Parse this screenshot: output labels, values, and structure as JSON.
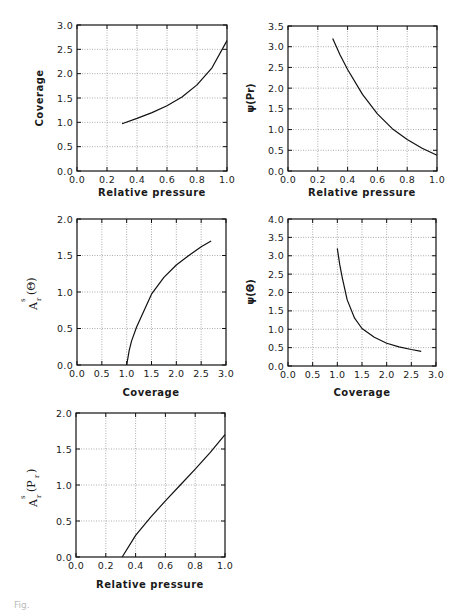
{
  "figure": {
    "caption_stub": "Fig."
  },
  "chart_data": [
    {
      "id": "coverage-vs-pressure",
      "type": "line",
      "title": "",
      "xlabel": "Relative pressure",
      "ylabel": "Coverage",
      "xlim": [
        0.0,
        1.0
      ],
      "ylim": [
        0.0,
        3.0
      ],
      "xticks": [
        "0.0",
        "0.2",
        "0.4",
        "0.6",
        "0.8",
        "1.0"
      ],
      "yticks": [
        "0.0",
        "0.5",
        "1.0",
        "1.5",
        "2.0",
        "2.5",
        "3.0"
      ],
      "grid": true,
      "frame": {
        "left": 77,
        "top": 25,
        "right": 227,
        "bottom": 171
      },
      "series": [
        {
          "name": "Coverage",
          "x": [
            0.3,
            0.4,
            0.5,
            0.6,
            0.7,
            0.8,
            0.9,
            1.0
          ],
          "y": [
            0.97,
            1.08,
            1.2,
            1.34,
            1.52,
            1.77,
            2.12,
            2.68
          ]
        }
      ]
    },
    {
      "id": "psi-vs-pressure",
      "type": "line",
      "title": "",
      "xlabel": "Relative pressure",
      "ylabel": "ψ(Pr)",
      "xlim": [
        0.0,
        1.0
      ],
      "ylim": [
        0.0,
        3.5
      ],
      "xticks": [
        "0.0",
        "0.2",
        "0.4",
        "0.6",
        "0.8",
        "1.0"
      ],
      "yticks": [
        "0.0",
        "0.5",
        "1.0",
        "1.5",
        "2.0",
        "2.5",
        "3.0",
        "3.5"
      ],
      "grid": true,
      "frame": {
        "left": 288,
        "top": 26,
        "right": 437,
        "bottom": 171
      },
      "series": [
        {
          "name": "psi(Pr)",
          "x": [
            0.3,
            0.35,
            0.4,
            0.5,
            0.6,
            0.7,
            0.8,
            0.9,
            1.0
          ],
          "y": [
            3.2,
            2.8,
            2.45,
            1.85,
            1.38,
            1.02,
            0.76,
            0.55,
            0.38
          ]
        }
      ]
    },
    {
      "id": "area-vs-coverage",
      "type": "line",
      "title": "",
      "xlabel": "Coverage",
      "ylabel": "A^s_r(Θ)",
      "xlim": [
        0.0,
        3.0
      ],
      "ylim": [
        0.0,
        2.0
      ],
      "xticks": [
        "0.0",
        "0.5",
        "1.0",
        "1.5",
        "2.0",
        "2.5",
        "3.0"
      ],
      "yticks": [
        "0.0",
        "0.5",
        "1.0",
        "1.5",
        "2.0"
      ],
      "grid": true,
      "frame": {
        "left": 77,
        "top": 219,
        "right": 226,
        "bottom": 365
      },
      "series": [
        {
          "name": "A_r^s(theta)",
          "x": [
            1.0,
            1.05,
            1.1,
            1.2,
            1.3,
            1.5,
            1.75,
            2.0,
            2.25,
            2.5,
            2.7
          ],
          "y": [
            0.0,
            0.2,
            0.33,
            0.52,
            0.67,
            0.97,
            1.2,
            1.37,
            1.5,
            1.62,
            1.7
          ]
        }
      ]
    },
    {
      "id": "psi-vs-coverage",
      "type": "line",
      "title": "",
      "xlabel": "Coverage",
      "ylabel": "ψ(Θ)",
      "xlim": [
        0.0,
        3.0
      ],
      "ylim": [
        0.0,
        4.0
      ],
      "xticks": [
        "0.0",
        "0.5",
        "1.0",
        "1.5",
        "2.0",
        "2.5",
        "3.0"
      ],
      "yticks": [
        "0.0",
        "0.5",
        "1.0",
        "1.5",
        "2.0",
        "2.5",
        "3.0",
        "3.5",
        "4.0"
      ],
      "grid": true,
      "frame": {
        "left": 288,
        "top": 219,
        "right": 436,
        "bottom": 366
      },
      "series": [
        {
          "name": "psi(theta)",
          "x": [
            1.0,
            1.05,
            1.1,
            1.2,
            1.35,
            1.5,
            1.75,
            2.0,
            2.25,
            2.5,
            2.7
          ],
          "y": [
            3.2,
            2.75,
            2.4,
            1.8,
            1.3,
            1.02,
            0.78,
            0.62,
            0.52,
            0.45,
            0.4
          ]
        }
      ]
    },
    {
      "id": "area-vs-pressure",
      "type": "line",
      "title": "",
      "xlabel": "Relative pressure",
      "ylabel": "A^s_r(P_r)",
      "xlim": [
        0.0,
        1.0
      ],
      "ylim": [
        0.0,
        2.0
      ],
      "xticks": [
        "0.0",
        "0.2",
        "0.4",
        "0.6",
        "0.8",
        "1.0"
      ],
      "yticks": [
        "0.0",
        "0.5",
        "1.0",
        "1.5",
        "2.0"
      ],
      "grid": true,
      "frame": {
        "left": 76,
        "top": 413,
        "right": 225,
        "bottom": 557
      },
      "series": [
        {
          "name": "A_r^s(Pr)",
          "x": [
            0.31,
            0.4,
            0.5,
            0.6,
            0.7,
            0.8,
            0.9,
            1.0
          ],
          "y": [
            0.0,
            0.3,
            0.55,
            0.78,
            1.0,
            1.22,
            1.45,
            1.7
          ]
        }
      ]
    }
  ],
  "labels": {
    "p1": {
      "xlabel": "Relative pressure",
      "ylabel": "Coverage"
    },
    "p2": {
      "xlabel": "Relative pressure",
      "ylabel_main": "ψ(Pr)"
    },
    "p3": {
      "xlabel": "Coverage",
      "y_base": "A",
      "y_sup": "s",
      "y_sub": "r",
      "y_arg": "(Θ)"
    },
    "p4": {
      "xlabel": "Coverage",
      "ylabel_main": "ψ(Θ)"
    },
    "p5": {
      "xlabel": "Relative pressure",
      "y_base": "A",
      "y_sup": "s",
      "y_sub": "r",
      "y_arg_open": "(P",
      "y_arg_sub": "r",
      "y_arg_close": ")"
    }
  }
}
